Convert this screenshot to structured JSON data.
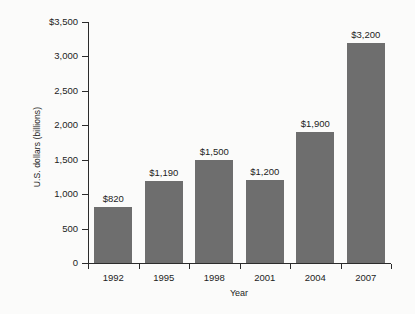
{
  "chart_data": {
    "type": "bar",
    "title": "",
    "xlabel": "Year",
    "ylabel": "U.S. dollars (billions)",
    "categories": [
      "1992",
      "1995",
      "1998",
      "2001",
      "2004",
      "2007"
    ],
    "values": [
      820,
      1190,
      1500,
      1200,
      1900,
      3200
    ],
    "data_labels": [
      "$820",
      "$1,190",
      "$1,500",
      "$1,200",
      "$1,900",
      "$3,200"
    ],
    "ylim": [
      0,
      3500
    ],
    "ytick_values": [
      0,
      500,
      1000,
      1500,
      2000,
      2500,
      3000,
      3500
    ],
    "ytick_labels": [
      "0",
      "500",
      "1,000",
      "1,500",
      "2,000",
      "2,500",
      "3,000",
      "$3,500"
    ],
    "grid": false,
    "legend": false,
    "bar_color": "#6e6e6e",
    "axis_color": "#2b2b2b",
    "background_color": "#fbfbfa"
  }
}
